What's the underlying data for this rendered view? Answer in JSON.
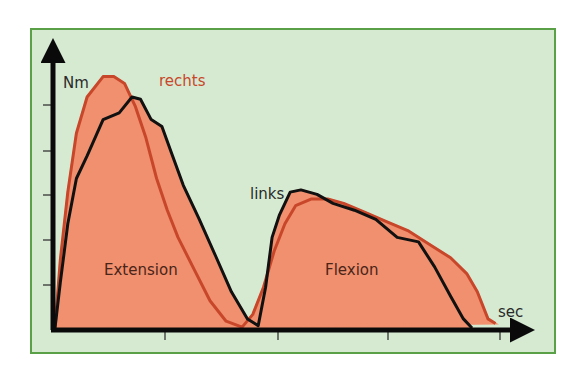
{
  "colors": {
    "frame_border": "#5aa046",
    "frame_background": "#d6ead2",
    "fill": "#f0906e",
    "links_line": "#111111",
    "rechts_line": "#c8472a",
    "axis": "#0a0a0a"
  },
  "labels": {
    "y_axis": "Nm",
    "x_axis": "sec",
    "rechts": "rechts",
    "links": "links",
    "extension": "Extension",
    "flexion": "Flexion"
  },
  "chart_data": {
    "type": "area",
    "title": "",
    "xlabel": "sec",
    "ylabel": "Nm",
    "grid": false,
    "legend": "inline labels (rechts, links)",
    "x_ticks": 4,
    "y_ticks": 6,
    "xlim": [
      0,
      4.3
    ],
    "ylim": [
      0,
      6
    ],
    "annotations": [
      "Extension",
      "Flexion"
    ],
    "series": [
      {
        "name": "links",
        "color": "#111111",
        "x": [
          0,
          0.05,
          0.12,
          0.2,
          0.3,
          0.45,
          0.6,
          0.72,
          0.8,
          0.9,
          1.0,
          1.1,
          1.2,
          1.35,
          1.5,
          1.65,
          1.8,
          1.9,
          1.97,
          2.03,
          2.1,
          2.2,
          2.3,
          2.45,
          2.6,
          2.8,
          3.0,
          3.2,
          3.4,
          3.55,
          3.7,
          3.82,
          3.9
        ],
        "y": [
          0,
          1.0,
          2.3,
          3.3,
          3.8,
          4.6,
          4.75,
          5.1,
          5.05,
          4.6,
          4.45,
          3.8,
          3.15,
          2.4,
          1.6,
          0.8,
          0.2,
          0.05,
          0.9,
          2.0,
          2.5,
          3.0,
          3.05,
          2.95,
          2.75,
          2.6,
          2.4,
          2.0,
          1.9,
          1.35,
          0.7,
          0.2,
          0
        ]
      },
      {
        "name": "rechts",
        "color": "#c8472a",
        "x": [
          0,
          0.05,
          0.12,
          0.2,
          0.3,
          0.45,
          0.55,
          0.65,
          0.75,
          0.85,
          0.95,
          1.05,
          1.15,
          1.3,
          1.45,
          1.6,
          1.75,
          1.85,
          1.95,
          2.05,
          2.15,
          2.25,
          2.4,
          2.55,
          2.7,
          2.9,
          3.1,
          3.3,
          3.5,
          3.7,
          3.85,
          3.95,
          4.05,
          4.12
        ],
        "y": [
          0,
          1.5,
          3.0,
          4.3,
          5.1,
          5.55,
          5.55,
          5.4,
          4.9,
          4.2,
          3.3,
          2.6,
          2.0,
          1.3,
          0.6,
          0.15,
          0.02,
          0.3,
          0.9,
          1.7,
          2.3,
          2.7,
          2.85,
          2.85,
          2.75,
          2.55,
          2.35,
          2.15,
          1.85,
          1.55,
          1.2,
          0.8,
          0.2,
          0.1
        ]
      }
    ]
  }
}
